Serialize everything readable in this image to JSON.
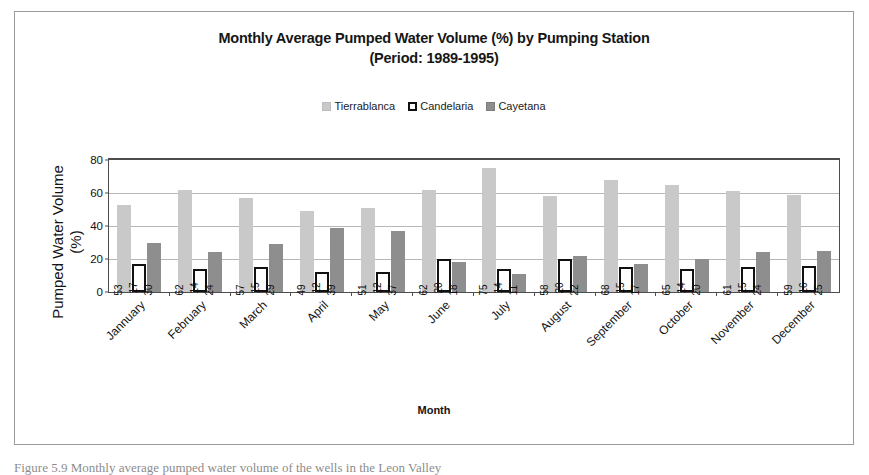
{
  "figure": {
    "title_line1": "Monthly Average Pumped Water Volume (%) by Pumping Station",
    "title_line2": "(Period: 1989-1995)",
    "xaxis_title": "Month",
    "yaxis_title_line1": "Pumped Water Volume",
    "yaxis_title_line2": "(%)",
    "caption": "Figure 5.9 Monthly average pumped water volume of the wells in the Leon Valley"
  },
  "legend": {
    "position": "top-center",
    "entries": [
      {
        "label": "Tierrablanca",
        "color": "#c9c9c9",
        "swatch": "legend-swatch-tierrablanca"
      },
      {
        "label": "Candelaria",
        "color": "#ffffff",
        "swatch": "legend-swatch-candelaria"
      },
      {
        "label": "Cayetana",
        "color": "#8e8e8e",
        "swatch": "legend-swatch-cayetana"
      }
    ]
  },
  "yaxis": {
    "ticks": [
      "0",
      "20",
      "40",
      "60",
      "80"
    ],
    "min": 0,
    "max": 80,
    "step": 20
  },
  "chart_data": {
    "type": "bar",
    "title": "Monthly Average Pumped Water Volume (%) by Pumping Station (Period: 1989-1995)",
    "xlabel": "Month",
    "ylabel": "Pumped Water Volume (%)",
    "ylim": [
      0,
      80
    ],
    "yticks": [
      0,
      20,
      40,
      60,
      80
    ],
    "grid": true,
    "legend_position": "top-center",
    "categories": [
      "Jannuary",
      "February",
      "March",
      "April",
      "May",
      "June",
      "July",
      "August",
      "September",
      "October",
      "November",
      "December"
    ],
    "series": [
      {
        "name": "Tierrablanca",
        "color": "#c9c9c9",
        "values": [
          53,
          62,
          57,
          49,
          51,
          62,
          75,
          58,
          68,
          65,
          61,
          59
        ]
      },
      {
        "name": "Candelaria",
        "color": "#ffffff",
        "values": [
          17,
          14,
          15,
          12,
          12,
          20,
          14,
          20,
          15,
          14,
          15,
          16
        ]
      },
      {
        "name": "Cayetana",
        "color": "#8e8e8e",
        "values": [
          30,
          24,
          29,
          39,
          37,
          18,
          11,
          22,
          17,
          20,
          24,
          25
        ]
      }
    ]
  }
}
